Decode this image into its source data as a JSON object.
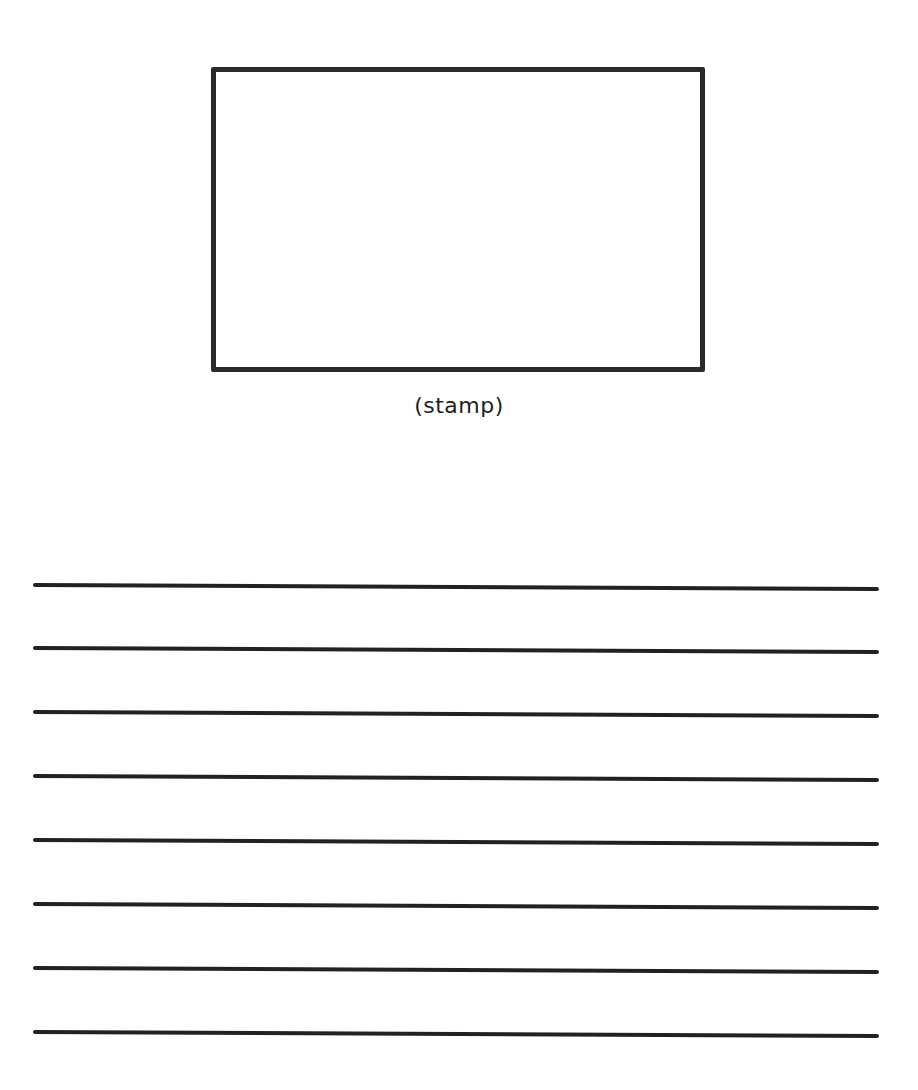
{
  "stamp": {
    "label": "(stamp)"
  },
  "address_lines": {
    "count": 8
  },
  "colors": {
    "ink": "#222222",
    "background": "#ffffff"
  }
}
